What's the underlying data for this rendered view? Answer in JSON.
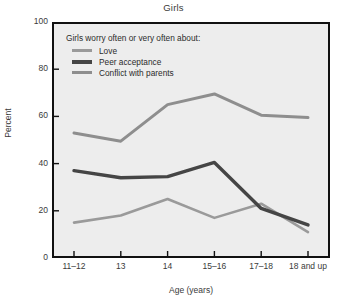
{
  "chart_data": {
    "type": "line",
    "title": "Girls",
    "xlabel": "Age (years)",
    "ylabel": "Percent",
    "ylim": [
      0,
      100
    ],
    "yticks": [
      0,
      20,
      40,
      60,
      80,
      100
    ],
    "grid": false,
    "legend_position": "inside top-left",
    "legend_title": "Girls worry often or very often about:",
    "categories": [
      "11–12",
      "13",
      "14",
      "15–16",
      "17–18",
      "18 and up"
    ],
    "series": [
      {
        "name": "Love",
        "color": "#9a9a9a",
        "width": 2.6,
        "values": [
          15,
          18,
          25,
          17,
          23,
          11
        ]
      },
      {
        "name": "Peer acceptance",
        "color": "#454545",
        "width": 3.4,
        "values": [
          37,
          34,
          34.5,
          40.5,
          21,
          14
        ]
      },
      {
        "name": "Conflict with parents",
        "color": "#8e8e8e",
        "width": 3.0,
        "values": [
          53,
          49.5,
          65,
          69.5,
          60.5,
          59.5
        ]
      }
    ]
  },
  "style": {
    "plot_background": "#ededed",
    "axis_color": "#111111",
    "text_color": "#2b2b2b",
    "page_background": "#ffffff"
  }
}
